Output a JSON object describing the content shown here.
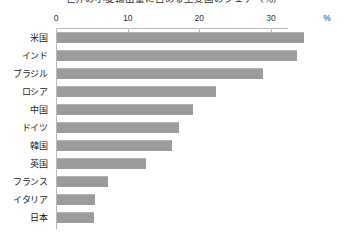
{
  "chart_data": {
    "type": "bar",
    "orientation": "horizontal",
    "title": "世界の小麦輸出量に占める主要国のシェア（％）",
    "xlabel": "",
    "ylabel": "",
    "unit_label": "%",
    "xlim": [
      0,
      32.4
    ],
    "xticks": [
      0,
      10,
      20,
      30
    ],
    "xtick_labels": [
      "0",
      "10",
      "20",
      "30"
    ],
    "grid": false,
    "legend": false,
    "bar_color": "#9c9c9c",
    "axis_color": "#b9b9b9",
    "axis_position": "top",
    "categories": [
      "米国",
      "インド",
      "ブラジル",
      "ロシア",
      "中国",
      "ドイツ",
      "韓国",
      "英国",
      "フランス",
      "イタリア",
      "日本"
    ],
    "values": [
      34.5,
      33.5,
      28.8,
      22.2,
      19.0,
      17.0,
      16.0,
      12.4,
      7.1,
      5.3,
      5.2
    ],
    "points": [
      {
        "category": "米国",
        "value": 34.5
      },
      {
        "category": "インド",
        "value": 33.5
      },
      {
        "category": "ブラジル",
        "value": 28.8
      },
      {
        "category": "ロシア",
        "value": 22.2
      },
      {
        "category": "中国",
        "value": 19.0
      },
      {
        "category": "ドイツ",
        "value": 17.0
      },
      {
        "category": "韓国",
        "value": 16.0
      },
      {
        "category": "英国",
        "value": 12.4
      },
      {
        "category": "フランス",
        "value": 7.1
      },
      {
        "category": "イタリア",
        "value": 5.3
      },
      {
        "category": "日本",
        "value": 5.2
      }
    ]
  }
}
